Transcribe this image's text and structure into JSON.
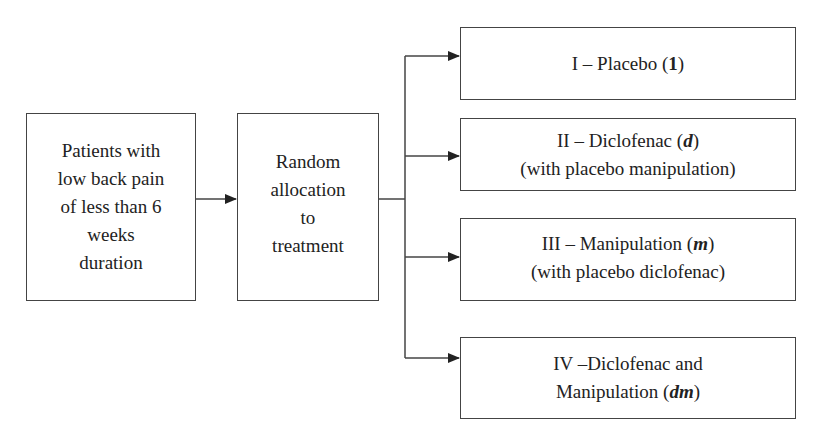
{
  "diagram": {
    "type": "flowchart",
    "nodes": [
      {
        "id": "patients",
        "lines": [
          "Patients with",
          "low back pain",
          "of less than 6",
          "weeks",
          "duration"
        ]
      },
      {
        "id": "random",
        "lines": [
          "Random",
          "allocation",
          "to",
          "treatment"
        ]
      },
      {
        "id": "group1",
        "line1_prefix": "I – Placebo (",
        "line1_symbol": "1",
        "line1_suffix": ")",
        "line2": ""
      },
      {
        "id": "group2",
        "line1_prefix": "II – Diclofenac (",
        "line1_symbol": "d",
        "line1_suffix": ")",
        "line2": "(with placebo manipulation)"
      },
      {
        "id": "group3",
        "line1_prefix": "III – Manipulation (",
        "line1_symbol": "m",
        "line1_suffix": ")",
        "line2": "(with placebo diclofenac)"
      },
      {
        "id": "group4",
        "line1_prefix": "IV –Diclofenac and",
        "line2_prefix": "Manipulation (",
        "line2_symbol": "dm",
        "line2_suffix": ")"
      }
    ],
    "edges": [
      {
        "from": "patients",
        "to": "random"
      },
      {
        "from": "random",
        "to": "group1"
      },
      {
        "from": "random",
        "to": "group2"
      },
      {
        "from": "random",
        "to": "group3"
      },
      {
        "from": "random",
        "to": "group4"
      }
    ],
    "colors": {
      "stroke": "#444444",
      "text": "#222222",
      "background": "#ffffff"
    }
  }
}
